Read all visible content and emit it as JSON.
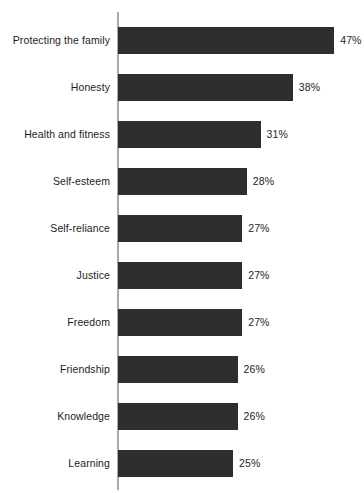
{
  "chart_data": {
    "type": "bar",
    "orientation": "horizontal",
    "title": "",
    "xlabel": "",
    "ylabel": "",
    "grid": false,
    "legend": null,
    "axis": {
      "category_axis": "vertical-left",
      "value_axis_visible": false,
      "value_ticks": [],
      "xlim": [
        0,
        50
      ]
    },
    "value_suffix": "%",
    "categories": [
      "Protecting the family",
      "Honesty",
      "Health and fitness",
      "Self-esteem",
      "Self-reliance",
      "Justice",
      "Freedom",
      "Friendship",
      "Knowledge",
      "Learning"
    ],
    "values": [
      47,
      38,
      31,
      28,
      27,
      27,
      27,
      26,
      26,
      25
    ],
    "value_labels": [
      "47%",
      "38%",
      "31%",
      "28%",
      "27%",
      "27%",
      "27%",
      "26%",
      "26%",
      "25%"
    ],
    "colors": {
      "bar": "#2e2e2e",
      "axis": "#a9a9a9",
      "text": "#1d1d1d",
      "background": "#ffffff"
    }
  }
}
